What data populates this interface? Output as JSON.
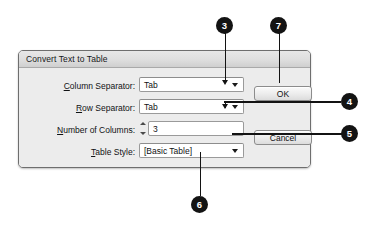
{
  "dialog": {
    "title": "Convert Text to Table",
    "fields": [
      {
        "label_prefix": "",
        "label_accel": "C",
        "label_rest": "olumn Separator:",
        "label_full": "Column Separator:",
        "type": "combo",
        "value": "Tab",
        "arrow_icon": "chevron-down-icon"
      },
      {
        "label_prefix": "",
        "label_accel": "R",
        "label_rest": "ow Separator:",
        "label_full": "Row Separator:",
        "type": "combo",
        "value": "Tab",
        "arrow_icon": "chevron-down-icon"
      },
      {
        "label_prefix": "",
        "label_accel": "N",
        "label_rest": "umber of Columns:",
        "label_full": "Number of Columns:",
        "type": "stepper",
        "value": "3",
        "up_icon": "stepper-up-icon",
        "down_icon": "stepper-down-icon"
      },
      {
        "label_prefix": "",
        "label_accel": "T",
        "label_rest": "able Style:",
        "label_full": "Table Style:",
        "type": "combo",
        "value": "[Basic Table]",
        "arrow_icon": "chevron-down-icon"
      }
    ],
    "buttons": {
      "ok": "OK",
      "cancel": "Cancel"
    }
  },
  "callouts": [
    {
      "number": "3",
      "target": "column-separator-dropdown-arrow"
    },
    {
      "number": "7",
      "target": "ok-button"
    },
    {
      "number": "4",
      "target": "row-separator-dropdown-arrow"
    },
    {
      "number": "5",
      "target": "number-of-columns-field"
    },
    {
      "number": "6",
      "target": "table-style-dropdown-arrow"
    }
  ],
  "colors": {
    "callout_fill": "#131313",
    "callout_text": "#ffffff",
    "dialog_bg": "#ececec",
    "dialog_border": "#6e6e6e",
    "field_bg": "#ffffff",
    "text": "#101214"
  }
}
